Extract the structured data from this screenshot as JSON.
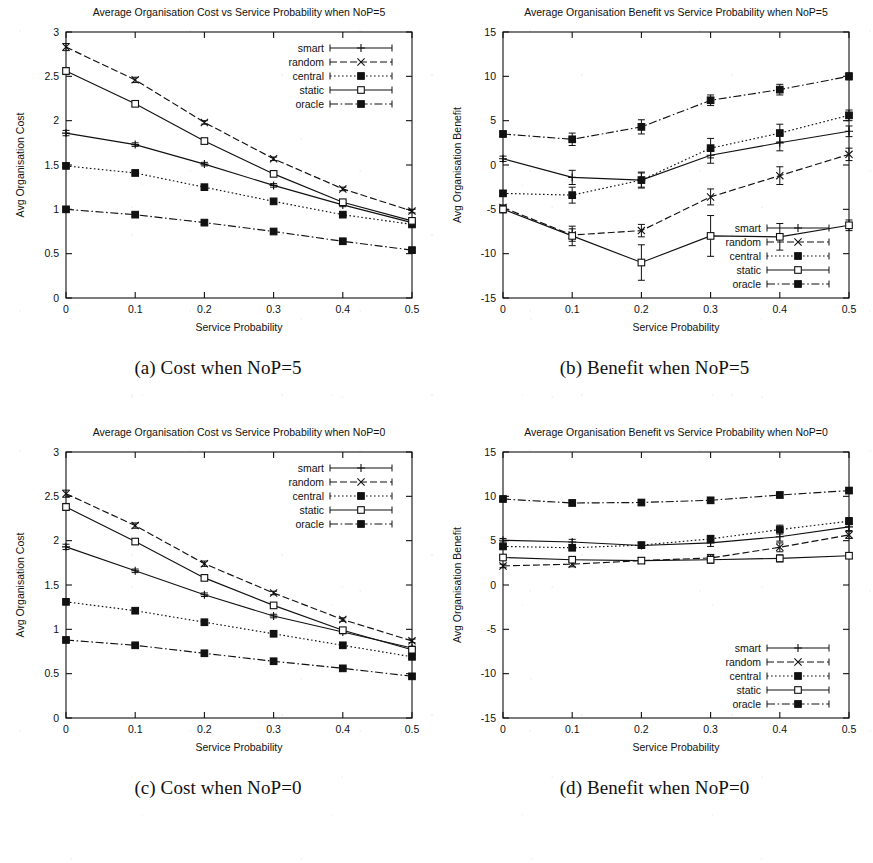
{
  "figure": {
    "name": "four-panel-line-charts",
    "background": "#ffffff",
    "ink": "#111111"
  },
  "series_names": [
    "smart",
    "random",
    "central",
    "static",
    "oracle"
  ],
  "legend": {
    "smart": "smart",
    "random": "random",
    "central": "central",
    "static": "static",
    "oracle": "oracle"
  },
  "captions": {
    "a": "(a) Cost when NoP=5",
    "b": "(b) Benefit when NoP=5",
    "c": "(c) Cost when NoP=0",
    "d": "(d) Benefit when NoP=0"
  },
  "axis_titles": {
    "x": "Service Probability",
    "y_cost": "Avg Organisation Cost",
    "y_benefit": "Avg Organisation Benefit"
  },
  "x_ticks": [
    "0",
    "0.1",
    "0.2",
    "0.3",
    "0.4",
    "0.5"
  ],
  "y_ticks_cost": [
    "0",
    "0.5",
    "1",
    "1.5",
    "2",
    "2.5",
    "3"
  ],
  "y_ticks_benefit": [
    "-15",
    "-10",
    "-5",
    "0",
    "5",
    "10",
    "15"
  ],
  "chart_data": [
    {
      "id": "a",
      "type": "line",
      "title": "Average Organisation Cost vs Service Probability when NoP=5",
      "xlabel": "Service Probability",
      "ylabel": "Avg Organisation Cost",
      "x": [
        0,
        0.1,
        0.2,
        0.3,
        0.4,
        0.5
      ],
      "xlim": [
        0,
        0.5
      ],
      "ylim": [
        0,
        3
      ],
      "grid": false,
      "legend_position": "top-right",
      "series": [
        {
          "name": "smart",
          "values": [
            1.86,
            1.73,
            1.51,
            1.27,
            1.05,
            0.85
          ],
          "err": [
            0.03,
            0.02,
            0.02,
            0.02,
            0.02,
            0.02
          ],
          "dash": "solid",
          "marker": "plus"
        },
        {
          "name": "random",
          "values": [
            2.83,
            2.46,
            1.98,
            1.57,
            1.23,
            0.98
          ],
          "err": [
            0.04,
            0.03,
            0.02,
            0.02,
            0.02,
            0.02
          ],
          "dash": "dashed",
          "marker": "cross"
        },
        {
          "name": "central",
          "values": [
            1.49,
            1.41,
            1.25,
            1.09,
            0.94,
            0.83
          ],
          "err": [
            0.02,
            0.02,
            0.02,
            0.02,
            0.02,
            0.02
          ],
          "dash": "dotted",
          "marker": "square-filled"
        },
        {
          "name": "static",
          "values": [
            2.56,
            2.19,
            1.77,
            1.4,
            1.08,
            0.87
          ],
          "err": [
            0.04,
            0.03,
            0.03,
            0.02,
            0.02,
            0.02
          ],
          "dash": "solid",
          "marker": "square-open"
        },
        {
          "name": "oracle",
          "values": [
            1.0,
            0.94,
            0.85,
            0.75,
            0.64,
            0.54
          ],
          "err": [
            0.02,
            0.02,
            0.02,
            0.02,
            0.02,
            0.02
          ],
          "dash": "dashdot",
          "marker": "square-filled"
        }
      ]
    },
    {
      "id": "b",
      "type": "line",
      "title": "Average Organisation Benefit vs Service Probability when NoP=5",
      "xlabel": "Service Probability",
      "ylabel": "Avg Organisation Benefit",
      "x": [
        0,
        0.1,
        0.2,
        0.3,
        0.4,
        0.5
      ],
      "xlim": [
        0,
        0.5
      ],
      "ylim": [
        -15,
        15
      ],
      "grid": false,
      "legend_position": "bottom-right",
      "series": [
        {
          "name": "smart",
          "values": [
            0.7,
            -1.4,
            -1.7,
            1.1,
            2.5,
            3.8
          ],
          "err": [
            0.3,
            0.8,
            0.8,
            0.9,
            0.9,
            0.6
          ],
          "dash": "solid",
          "marker": "plus"
        },
        {
          "name": "random",
          "values": [
            -4.8,
            -7.9,
            -7.4,
            -3.6,
            -1.2,
            1.2
          ],
          "err": [
            0.3,
            0.7,
            0.7,
            0.9,
            1.0,
            0.7
          ],
          "dash": "dashed",
          "marker": "cross"
        },
        {
          "name": "central",
          "values": [
            -3.2,
            -3.4,
            -1.7,
            1.9,
            3.6,
            5.6
          ],
          "err": [
            0.3,
            0.9,
            0.9,
            1.1,
            1.0,
            0.6
          ],
          "dash": "dotted",
          "marker": "square-filled"
        },
        {
          "name": "static",
          "values": [
            -5.0,
            -8.0,
            -11.0,
            -8.0,
            -8.1,
            -6.8
          ],
          "err": [
            0.4,
            1.1,
            2.0,
            2.3,
            1.5,
            0.6
          ],
          "dash": "solid",
          "marker": "square-open"
        },
        {
          "name": "oracle",
          "values": [
            3.5,
            2.9,
            4.3,
            7.3,
            8.5,
            10.0
          ],
          "err": [
            0.3,
            0.7,
            0.8,
            0.6,
            0.6,
            0.4
          ],
          "dash": "dashdot",
          "marker": "square-filled"
        }
      ]
    },
    {
      "id": "c",
      "type": "line",
      "title": "Average Organisation Cost vs Service Probability when NoP=0",
      "xlabel": "Service Probability",
      "ylabel": "Avg Organisation Cost",
      "x": [
        0,
        0.1,
        0.2,
        0.3,
        0.4,
        0.5
      ],
      "xlim": [
        0,
        0.5
      ],
      "ylim": [
        0,
        3
      ],
      "grid": false,
      "legend_position": "top-right",
      "series": [
        {
          "name": "smart",
          "values": [
            1.93,
            1.66,
            1.39,
            1.15,
            0.97,
            0.79
          ],
          "err": [
            0.03,
            0.02,
            0.02,
            0.02,
            0.02,
            0.02
          ],
          "dash": "solid",
          "marker": "plus"
        },
        {
          "name": "random",
          "values": [
            2.53,
            2.17,
            1.74,
            1.41,
            1.11,
            0.87
          ],
          "err": [
            0.04,
            0.03,
            0.03,
            0.02,
            0.02,
            0.02
          ],
          "dash": "dashed",
          "marker": "cross"
        },
        {
          "name": "central",
          "values": [
            1.31,
            1.21,
            1.08,
            0.95,
            0.82,
            0.69
          ],
          "err": [
            0.02,
            0.02,
            0.02,
            0.02,
            0.02,
            0.02
          ],
          "dash": "dotted",
          "marker": "square-filled"
        },
        {
          "name": "static",
          "values": [
            2.38,
            1.99,
            1.58,
            1.27,
            0.99,
            0.77
          ],
          "err": [
            0.04,
            0.03,
            0.03,
            0.02,
            0.02,
            0.02
          ],
          "dash": "solid",
          "marker": "square-open"
        },
        {
          "name": "oracle",
          "values": [
            0.88,
            0.82,
            0.73,
            0.64,
            0.56,
            0.47
          ],
          "err": [
            0.02,
            0.02,
            0.02,
            0.02,
            0.02,
            0.02
          ],
          "dash": "dashdot",
          "marker": "square-filled"
        }
      ]
    },
    {
      "id": "d",
      "type": "line",
      "title": "Average Organisation Benefit vs Service Probability when NoP=0",
      "xlabel": "Service Probability",
      "ylabel": "Avg Organisation Benefit",
      "x": [
        0,
        0.1,
        0.2,
        0.3,
        0.4,
        0.5
      ],
      "xlim": [
        0,
        0.5
      ],
      "ylim": [
        -15,
        15
      ],
      "grid": false,
      "legend_position": "bottom-right",
      "series": [
        {
          "name": "smart",
          "values": [
            5.05,
            4.85,
            4.45,
            4.75,
            5.45,
            6.55
          ],
          "err": [
            0.2,
            0.3,
            0.3,
            0.4,
            0.5,
            0.4
          ],
          "dash": "solid",
          "marker": "plus"
        },
        {
          "name": "random",
          "values": [
            2.15,
            2.35,
            2.75,
            3.05,
            4.25,
            5.65
          ],
          "err": [
            0.2,
            0.3,
            0.3,
            0.4,
            0.5,
            0.4
          ],
          "dash": "dashed",
          "marker": "cross"
        },
        {
          "name": "central",
          "values": [
            4.35,
            4.2,
            4.5,
            5.2,
            6.25,
            7.2
          ],
          "err": [
            0.2,
            0.3,
            0.3,
            0.4,
            0.5,
            0.4
          ],
          "dash": "dotted",
          "marker": "square-filled"
        },
        {
          "name": "static",
          "values": [
            3.1,
            2.85,
            2.75,
            2.85,
            3.0,
            3.3
          ],
          "err": [
            0.2,
            0.3,
            0.3,
            0.4,
            0.4,
            0.3
          ],
          "dash": "solid",
          "marker": "square-open"
        },
        {
          "name": "oracle",
          "values": [
            9.7,
            9.25,
            9.3,
            9.55,
            10.15,
            10.65
          ],
          "err": [
            0.2,
            0.3,
            0.3,
            0.3,
            0.3,
            0.3
          ],
          "dash": "dashdot",
          "marker": "square-filled"
        }
      ]
    }
  ]
}
